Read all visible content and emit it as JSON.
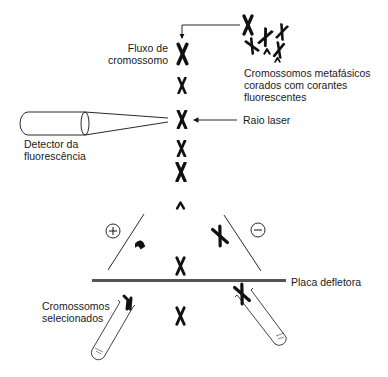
{
  "diagram": {
    "labels": {
      "chromosome_flow": "Fluxo de\ncromossomo",
      "metaphase_chromosomes": "Cromossomos metafásicos\ncorados com corantes\nfluorescentes",
      "laser_beam": "Raio laser",
      "fluorescence_detector": "Detector da\nfluorescência",
      "deflector_plate": "Placa defletora",
      "selected_chromosomes": "Cromossomos\nselecionados"
    },
    "symbols": {
      "positive_charge": "+",
      "negative_charge": "−"
    },
    "colors": {
      "ink": "#111111",
      "plate": "#555555",
      "background": "#ffffff"
    }
  }
}
